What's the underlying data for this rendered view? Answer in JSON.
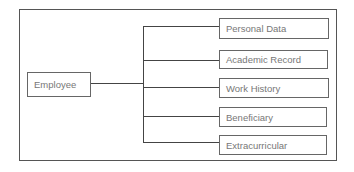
{
  "diagram": {
    "root": {
      "label": "Employee"
    },
    "children": [
      {
        "label": "Personal Data"
      },
      {
        "label": "Academic Record"
      },
      {
        "label": "Work History"
      },
      {
        "label": "Beneficiary"
      },
      {
        "label": "Extracurricular"
      }
    ],
    "colors": {
      "border": "#555555",
      "text": "#777777",
      "line": "#444444"
    }
  }
}
